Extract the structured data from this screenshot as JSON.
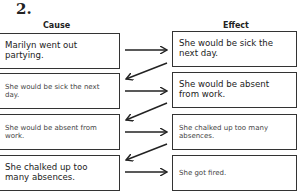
{
  "exercise_number": "2.",
  "headers": {
    "cause": "Cause",
    "effect": "Effect"
  },
  "rows": [
    {
      "cause": "Marilyn went out partying.",
      "effect": "She would be sick the next day."
    },
    {
      "cause": "She would be sick the next day.",
      "effect": "She would be absent from work."
    },
    {
      "cause": "She would be absent from work.",
      "effect": "She chalked up too many absences."
    },
    {
      "cause": "She chalked up too many absences.",
      "effect": "She got fired."
    }
  ]
}
